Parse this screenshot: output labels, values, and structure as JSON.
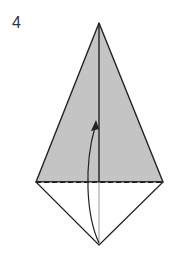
{
  "step": {
    "number": "4"
  },
  "diagram": {
    "type": "origami-fold",
    "colors": {
      "paper_colored": "#c4c4c4",
      "paper_white": "#ffffff",
      "line": "#222222"
    },
    "shape": "kite",
    "fold_line": "dashed horizontal valley fold",
    "arrow": "curved arrow pointing up from bottom tip"
  }
}
